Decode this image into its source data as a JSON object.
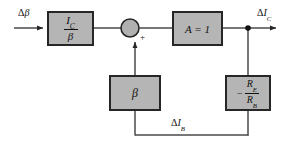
{
  "diagram": {
    "colors": {
      "block_fill": "#b5b5b5",
      "block_stroke": "#262626",
      "line": "#4a4a4a",
      "text": "#111111",
      "background": "#ffffff",
      "junction_fill": "#b0b0b0"
    },
    "blocks": [
      {
        "id": "gain-ic-over-beta",
        "name": "ic-over-beta-block",
        "numerator": "I",
        "numerator_sub": "C",
        "denominator": "β",
        "kind": "fraction",
        "x": 48,
        "y": 12,
        "w": 45,
        "h": 33
      },
      {
        "id": "gain-a",
        "name": "amplifier-block",
        "text": "A = 1",
        "kind": "plain",
        "x": 173,
        "y": 12,
        "w": 49,
        "h": 33
      },
      {
        "id": "feedback-beta",
        "name": "beta-feedback-block",
        "text": "β",
        "kind": "plain",
        "x": 110,
        "y": 76,
        "w": 50,
        "h": 34
      },
      {
        "id": "feedback-re-rb",
        "name": "re-over-rb-feedback-block",
        "sign": "−",
        "numerator": "R",
        "numerator_sub": "E",
        "denominator": "R",
        "denominator_sub": "B",
        "kind": "signed-fraction",
        "x": 226,
        "y": 76,
        "w": 44,
        "h": 34
      }
    ],
    "summing_junction": {
      "name": "summing-junction",
      "cx": 130,
      "cy": 28,
      "r": 9,
      "sign": "+"
    },
    "nodes": [
      {
        "name": "output-tap-node",
        "cx": 248,
        "cy": 28,
        "r": 2.6
      }
    ],
    "signals": [
      {
        "id": "input-delta-beta",
        "name": "input-signal-label",
        "delta": "Δ",
        "symbol": "β",
        "symbol_sub": "",
        "x": 18,
        "y": 8
      },
      {
        "id": "output-delta-ic",
        "name": "output-signal-label",
        "delta": "Δ",
        "symbol": "I",
        "symbol_sub": "C",
        "x": 258,
        "y": 8
      },
      {
        "id": "feedback-delta-ib",
        "name": "feedback-signal-label",
        "delta": "Δ",
        "symbol": "I",
        "symbol_sub": "B",
        "x": 172,
        "y": 118
      }
    ],
    "wires": [
      {
        "name": "wire-input-to-block",
        "d": "M 14 28 L 47 28"
      },
      {
        "name": "wire-block-to-summer",
        "d": "M 93 28 L 121 28"
      },
      {
        "name": "wire-summer-to-amplifier",
        "d": "M 139 28 L 172 28"
      },
      {
        "name": "wire-amplifier-to-output",
        "d": "M 222 28 L 280 28"
      },
      {
        "name": "wire-output-node-down",
        "d": "M 248 28 L 248 76"
      },
      {
        "name": "wire-rerb-down-to-feedback-bus",
        "d": "M 248 110 L 248 135"
      },
      {
        "name": "wire-feedback-bus",
        "d": "M 248 135 L 135 135"
      },
      {
        "name": "wire-feedback-bus-up-to-beta",
        "d": "M 135 135 L 135 110"
      },
      {
        "name": "wire-beta-up-to-summer",
        "d": "M 135 76 L 135 40"
      }
    ],
    "arrows": [
      {
        "name": "arrow-into-first-block",
        "x": 47,
        "y": 28,
        "dir": "right"
      },
      {
        "name": "arrow-into-summer",
        "x": 135,
        "y": 38,
        "dir": "up"
      },
      {
        "name": "arrow-output",
        "x": 280,
        "y": 28,
        "dir": "right"
      }
    ]
  }
}
